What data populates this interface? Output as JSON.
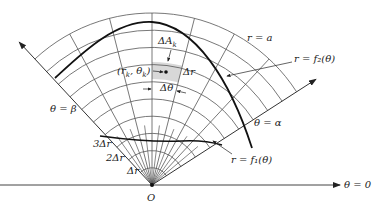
{
  "diagram": {
    "type": "polar-region-partition",
    "origin": {
      "label": "O",
      "x": 152,
      "y": 185
    },
    "grid": {
      "dr": 17.2,
      "arc_count": 10,
      "outer_radius": 172,
      "ray_angles_deg": [
        32.8,
        47.1,
        61.4,
        75.7,
        90,
        104.3,
        118.6,
        132.9
      ],
      "inner_fine_ray_angles_deg": [
        40,
        54.3,
        68.6,
        82.9,
        97.1,
        111.4,
        125.7
      ],
      "inner_fine_radius": 60
    },
    "shaded_cell": {
      "r_inner": 106,
      "r_outer": 123,
      "theta_from": 75.7,
      "theta_to": 90,
      "fill": "#d8d8d8"
    },
    "colors": {
      "line": "#555555",
      "curve": "#111111"
    }
  },
  "labels": {
    "r_eq_a": "r = a",
    "f2": "r = f₂(θ)",
    "f1": "r = f₁(θ)",
    "theta_alpha": "θ = α",
    "theta_beta": "θ = β",
    "theta_zero": "θ = 0",
    "delta_a": "ΔA",
    "delta_a_sub": "k",
    "point": "(r",
    "point_sub1": "k",
    "point_mid": ", θ",
    "point_sub2": "k",
    "point_end": ")",
    "delta_r_cell": "Δr",
    "delta_theta": "Δθ",
    "dr1": "Δr",
    "dr2": "2Δr",
    "dr3": "3Δr",
    "origin": "O"
  }
}
